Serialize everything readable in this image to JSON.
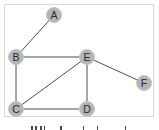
{
  "diagram": {
    "type": "undirected-graph",
    "colors": {
      "node_fill": "#b5b5b5",
      "node_stroke": "#c4c4c4",
      "edge": "#3a3a3a",
      "label": "#2a2a2a",
      "frame_border": "#d9d9d9"
    },
    "nodes": [
      {
        "id": "A",
        "label": "A"
      },
      {
        "id": "B",
        "label": "B"
      },
      {
        "id": "C",
        "label": "C"
      },
      {
        "id": "D",
        "label": "D"
      },
      {
        "id": "E",
        "label": "E"
      },
      {
        "id": "F",
        "label": "F"
      }
    ],
    "edges": [
      {
        "from": "A",
        "to": "B"
      },
      {
        "from": "B",
        "to": "E"
      },
      {
        "from": "B",
        "to": "C"
      },
      {
        "from": "C",
        "to": "E"
      },
      {
        "from": "C",
        "to": "D"
      },
      {
        "from": "E",
        "to": "D"
      },
      {
        "from": "E",
        "to": "F"
      }
    ]
  }
}
